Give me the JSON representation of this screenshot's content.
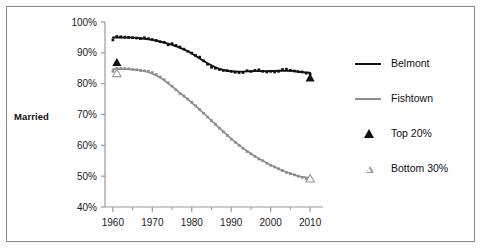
{
  "figure": {
    "title_fragment": "",
    "axis_label": "Married",
    "border_color": "#8a8a8a",
    "background": "#ffffff"
  },
  "legend": {
    "position": "right",
    "items": [
      {
        "label": "Belmont",
        "marker": "line",
        "color": "#111111"
      },
      {
        "label": "Fishtown",
        "marker": "line",
        "color": "#8d8d8d"
      },
      {
        "label": "Top 20%",
        "marker": "filled-triangle",
        "color": "#111111"
      },
      {
        "label": "Bottom 30%",
        "marker": "open-triangle",
        "color": "#9a9a9a"
      }
    ]
  },
  "chart_data": {
    "type": "line",
    "title": "",
    "xlabel": "",
    "ylabel": "Married",
    "xlim": [
      1958,
      2012
    ],
    "ylim": [
      40,
      100
    ],
    "ytick_labels": [
      "100%",
      "90%",
      "80%",
      "70%",
      "60%",
      "50%",
      "40%"
    ],
    "ytick_values": [
      100,
      90,
      80,
      70,
      60,
      50,
      40
    ],
    "xtick_labels": [
      "1960",
      "1970",
      "1980",
      "1990",
      "2000",
      "2010"
    ],
    "xtick_values": [
      1960,
      1970,
      1980,
      1990,
      2000,
      2010
    ],
    "minor_xticks": [
      1965,
      1975,
      1985,
      1995,
      2005
    ],
    "grid": false,
    "series": [
      {
        "name": "Belmont",
        "color": "#111111",
        "marker": "filled-square",
        "x": [
          1960,
          1961,
          1962,
          1963,
          1964,
          1965,
          1966,
          1967,
          1968,
          1969,
          1970,
          1971,
          1972,
          1973,
          1974,
          1975,
          1976,
          1977,
          1978,
          1979,
          1980,
          1981,
          1982,
          1983,
          1984,
          1985,
          1986,
          1987,
          1988,
          1989,
          1990,
          1991,
          1992,
          1993,
          1994,
          1995,
          1996,
          1997,
          1998,
          1999,
          2000,
          2001,
          2002,
          2003,
          2004,
          2005,
          2006,
          2007,
          2008,
          2009,
          2010
        ],
        "y": [
          94.2,
          95.3,
          95.2,
          95.1,
          95.0,
          94.9,
          94.8,
          94.6,
          94.9,
          94.6,
          94.3,
          94.0,
          93.6,
          93.4,
          92.6,
          93.0,
          92.4,
          91.9,
          91.2,
          90.5,
          89.9,
          89.1,
          88.6,
          87.4,
          86.3,
          85.3,
          85.0,
          84.6,
          84.3,
          84.2,
          84.0,
          83.7,
          83.6,
          83.6,
          84.2,
          84.0,
          84.3,
          84.5,
          84.0,
          83.8,
          84.0,
          83.8,
          84.0,
          84.6,
          84.7,
          84.3,
          84.1,
          83.9,
          83.8,
          83.4,
          83.0
        ]
      },
      {
        "name": "Fishtown",
        "color": "#8d8d8d",
        "marker": "filled-square",
        "x": [
          1960,
          1961,
          1962,
          1963,
          1964,
          1965,
          1966,
          1967,
          1968,
          1969,
          1970,
          1971,
          1972,
          1973,
          1974,
          1975,
          1976,
          1977,
          1978,
          1979,
          1980,
          1981,
          1982,
          1983,
          1984,
          1985,
          1986,
          1987,
          1988,
          1989,
          1990,
          1991,
          1992,
          1993,
          1994,
          1995,
          1996,
          1997,
          1998,
          1999,
          2000,
          2001,
          2002,
          2003,
          2004,
          2005,
          2006,
          2007,
          2008,
          2009,
          2010
        ],
        "y": [
          84.0,
          85.0,
          85.0,
          84.9,
          84.8,
          84.6,
          84.5,
          84.3,
          84.2,
          84.0,
          83.6,
          83.0,
          82.2,
          81.3,
          80.3,
          79.2,
          78.0,
          76.8,
          76.0,
          75.0,
          74.0,
          72.8,
          71.6,
          70.4,
          69.2,
          68.0,
          66.8,
          65.6,
          64.4,
          63.2,
          62.0,
          61.0,
          60.0,
          59.0,
          58.0,
          57.2,
          56.4,
          55.6,
          55.0,
          54.2,
          53.5,
          53.0,
          52.4,
          51.8,
          51.2,
          50.8,
          50.4,
          50.0,
          49.6,
          49.2,
          48.8
        ]
      }
    ],
    "point_markers": [
      {
        "label": "Top 20%",
        "x": 1961,
        "y": 87.0,
        "style": "filled-triangle",
        "color": "#111111"
      },
      {
        "label": "Bottom 30%",
        "x": 1961,
        "y": 83.5,
        "style": "open-triangle",
        "color": "#9a9a9a"
      },
      {
        "label": "Top 20%",
        "x": 2010,
        "y": 82.0,
        "style": "filled-triangle",
        "color": "#111111"
      },
      {
        "label": "Bottom 30%",
        "x": 2010,
        "y": 49.3,
        "style": "open-triangle",
        "color": "#9a9a9a"
      }
    ]
  }
}
